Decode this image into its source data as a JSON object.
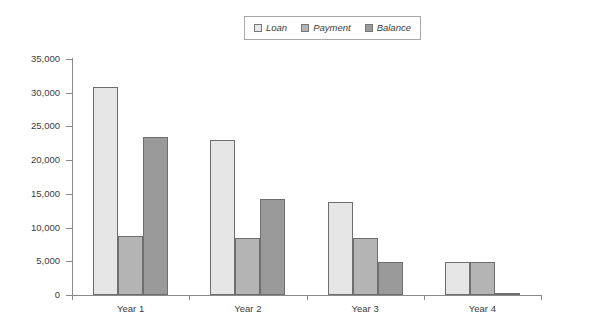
{
  "chart_data": {
    "type": "bar",
    "title": "",
    "subtitle": "",
    "xlabel": "",
    "ylabel": "",
    "categories": [
      "Year 1",
      "Year 2",
      "Year 3",
      "Year 4"
    ],
    "series": [
      {
        "name": "Loan",
        "color": "#e6e6e6",
        "values": [
          30900,
          23000,
          13800,
          4900
        ]
      },
      {
        "name": "Payment",
        "color": "#b4b4b4",
        "values": [
          8750,
          8500,
          8500,
          4900
        ]
      },
      {
        "name": "Balance",
        "color": "#9a9a9a",
        "values": [
          23400,
          14200,
          4900,
          100
        ]
      }
    ],
    "ylim": [
      0,
      35000
    ],
    "y_ticks": [
      0,
      5000,
      10000,
      15000,
      20000,
      25000,
      30000,
      35000
    ],
    "y_tick_labels": [
      "0",
      "5,000",
      "10,000",
      "15,000",
      "20,000",
      "25,000",
      "30,000",
      "35,000"
    ],
    "grid": false,
    "legend_position": "top-center",
    "legend_entries": [
      "Loan",
      "Payment",
      "Balance"
    ],
    "annotations": []
  },
  "legend": {
    "items": [
      {
        "label": "Loan",
        "icon": "square-swatch-icon",
        "color": "#e6e6e6"
      },
      {
        "label": "Payment",
        "icon": "square-swatch-icon",
        "color": "#b4b4b4"
      },
      {
        "label": "Balance",
        "icon": "square-swatch-icon",
        "color": "#9a9a9a"
      }
    ]
  }
}
